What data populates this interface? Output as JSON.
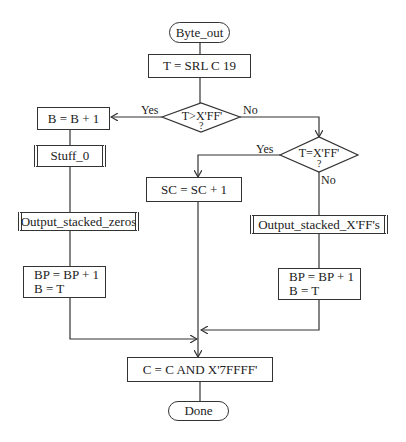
{
  "flowchart": {
    "start": "Byte_out",
    "nodes": {
      "shift": "T = SRL C 19",
      "decision1": "T>X'FF'",
      "decision1_q": "?",
      "decision2": "T=X'FF'",
      "decision2_q": "?",
      "inc_b": "B = B + 1",
      "stuff": "Stuff_0",
      "out_zeros": "Output_stacked_zeros",
      "left_bp_line1": "BP = BP + 1",
      "left_bp_line2": "B = T",
      "inc_sc": "SC = SC + 1",
      "out_ff": "Output_stacked_X'FF's",
      "right_bp_line1": "BP = BP + 1",
      "right_bp_line2": "B = T",
      "mask": "C = C AND X'7FFFF'"
    },
    "end": "Done",
    "labels": {
      "d1_yes": "Yes",
      "d1_no": "No",
      "d2_yes": "Yes",
      "d2_no": "No"
    }
  }
}
